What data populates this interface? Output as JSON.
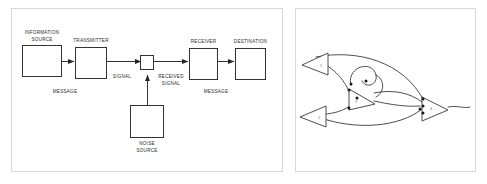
{
  "figure": {
    "panels": [
      {
        "name": "shannon-weaver-model",
        "index": 1
      },
      {
        "name": "abstract-cone-network",
        "index": 2
      }
    ]
  },
  "left_panel": {
    "boxes": [
      {
        "id": "information-source",
        "label_line1": "INFORMATION",
        "label_line2": "SOURCE",
        "x": 22,
        "y": 45,
        "w": 39,
        "h": 31,
        "label_pos": "above"
      },
      {
        "id": "transmitter",
        "label_line1": "TRANSMITTER",
        "label_line2": "",
        "x": 75,
        "y": 47,
        "w": 31,
        "h": 31,
        "label_pos": "above"
      },
      {
        "id": "noise-switch",
        "label_line1": "",
        "label_line2": "",
        "x": 140,
        "y": 56,
        "w": 13,
        "h": 14,
        "label_pos": "none"
      },
      {
        "id": "receiver",
        "label_line1": "RECEIVER",
        "label_line2": "",
        "x": 189,
        "y": 48,
        "w": 28,
        "h": 31,
        "label_pos": "above"
      },
      {
        "id": "destination",
        "label_line1": "DESTINATION",
        "label_line2": "",
        "x": 235,
        "y": 48,
        "w": 30,
        "h": 31,
        "label_pos": "above"
      },
      {
        "id": "noise-source",
        "label_line1": "NOISE",
        "label_line2": "SOURCE",
        "x": 130,
        "y": 105,
        "w": 33,
        "h": 32,
        "label_pos": "below"
      }
    ],
    "edge_labels": [
      {
        "id": "message-left",
        "line1": "MESSAGE",
        "line2": "",
        "x": 64,
        "y": 91
      },
      {
        "id": "signal",
        "line1": "SIGNAL",
        "line2": "",
        "x": 121,
        "y": 76
      },
      {
        "id": "received-signal",
        "line1": "RECEIVED",
        "line2": "SIGNAL",
        "x": 170,
        "y": 77
      },
      {
        "id": "message-right",
        "line1": "MESSAGE",
        "line2": "",
        "x": 215,
        "y": 91
      }
    ]
  },
  "right_panel": {
    "cones": [
      {
        "id": "cone-1",
        "numeral": "1"
      },
      {
        "id": "cone-2",
        "numeral": "2"
      },
      {
        "id": "cone-3",
        "numeral": "3"
      },
      {
        "id": "cone-4",
        "numeral": "4"
      }
    ],
    "node_count": 9
  },
  "colors": {
    "background": "#ffffff",
    "panel_border": "#d8d8d8",
    "diagram_stroke": "#333333",
    "art_stroke": "#3a3a3a",
    "text": "#2b2b2b"
  }
}
